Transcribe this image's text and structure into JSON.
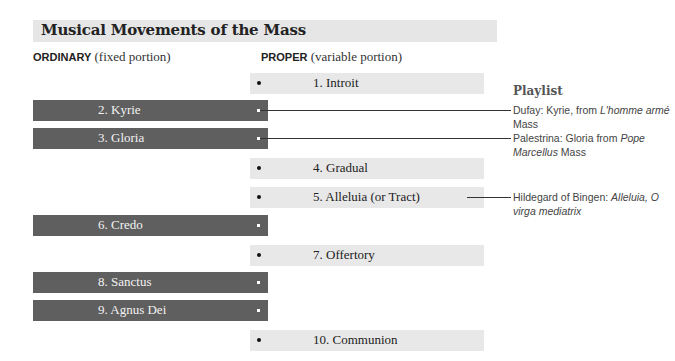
{
  "title": "Musical Movements of the Mass",
  "columns": {
    "ordinary": {
      "keyword": "ORDINARY",
      "note": " (fixed portion)"
    },
    "proper": {
      "keyword": "PROPER",
      "note": " (variable portion)"
    }
  },
  "movements": [
    {
      "number": 1,
      "label": "1. Introit",
      "type": "proper"
    },
    {
      "number": 2,
      "label": "2. Kyrie",
      "type": "ordinary"
    },
    {
      "number": 3,
      "label": "3. Gloria",
      "type": "ordinary"
    },
    {
      "number": 4,
      "label": "4. Gradual",
      "type": "proper"
    },
    {
      "number": 5,
      "label": "5. Alleluia (or Tract)",
      "type": "proper"
    },
    {
      "number": 6,
      "label": "6. Credo",
      "type": "ordinary"
    },
    {
      "number": 7,
      "label": "7. Offertory",
      "type": "proper"
    },
    {
      "number": 8,
      "label": "8. Sanctus",
      "type": "ordinary"
    },
    {
      "number": 9,
      "label": "9. Agnus Dei",
      "type": "ordinary"
    },
    {
      "number": 10,
      "label": "10. Communion",
      "type": "proper"
    }
  ],
  "playlist": {
    "heading": "Playlist",
    "items": [
      {
        "linked_to": "2. Kyrie",
        "prefix": "Dufay: Kyrie, from ",
        "italic": "L'homme armé",
        "suffix": " Mass"
      },
      {
        "linked_to": "3. Gloria",
        "prefix": "Palestrina: Gloria from ",
        "italic": "Pope Marcellus",
        "suffix": " Mass"
      },
      {
        "linked_to": "5. Alleluia (or Tract)",
        "prefix": "Hildegard of Bingen: ",
        "italic": "Alleluia, O virga mediatrix",
        "suffix": ""
      }
    ]
  },
  "colors": {
    "ordinary_bar": "#5f5f5f",
    "proper_bar": "#e8e8e8",
    "title_bar": "#e6e6e6"
  }
}
